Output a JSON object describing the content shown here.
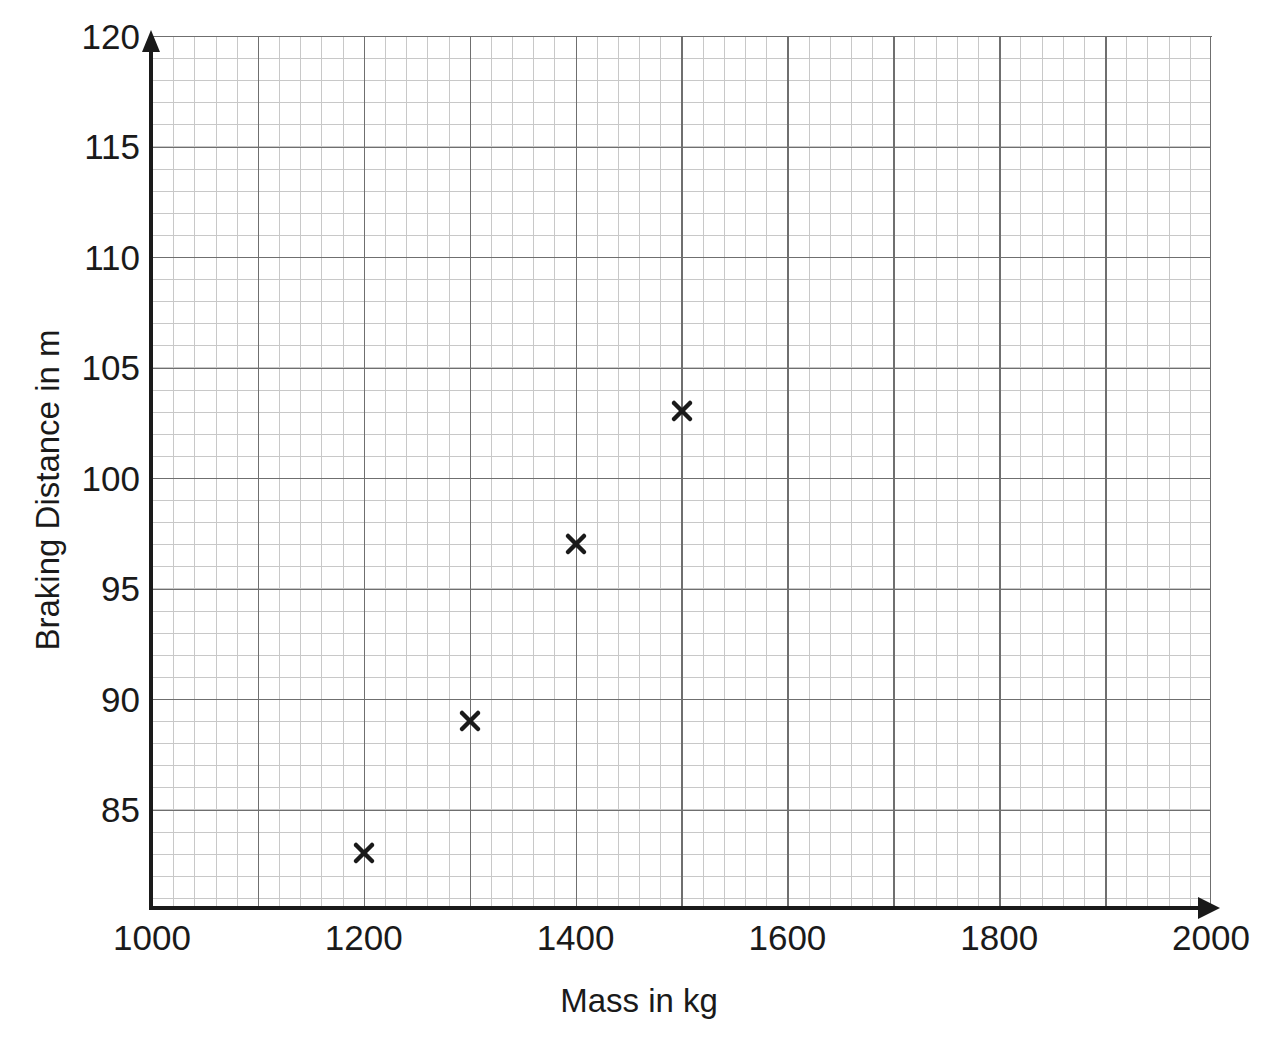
{
  "chart_data": {
    "type": "scatter",
    "title": "",
    "xlabel": "Mass in kg",
    "ylabel": "Braking Distance in m",
    "xlim": [
      1000,
      2000
    ],
    "ylim": [
      80.2,
      120
    ],
    "x_major_step": 200,
    "x_minor_step": 20,
    "y_major_step": 5,
    "y_minor_step": 1,
    "grid": true,
    "legend": null,
    "x_ticks": [
      "1000",
      "1200",
      "1400",
      "1600",
      "1800",
      "2000"
    ],
    "x_tick_values": [
      1000,
      1200,
      1400,
      1600,
      1800,
      2000
    ],
    "y_ticks": [
      "85",
      "90",
      "95",
      "100",
      "105",
      "110",
      "115",
      "120"
    ],
    "y_tick_values": [
      85,
      90,
      95,
      100,
      105,
      110,
      115,
      120
    ],
    "points": [
      {
        "x": 1200,
        "y": 83,
        "marker": "x-cross"
      },
      {
        "x": 1300,
        "y": 89,
        "marker": "x-cross"
      },
      {
        "x": 1400,
        "y": 97,
        "marker": "x-cross"
      },
      {
        "x": 1500,
        "y": 103,
        "marker": "x-cross"
      }
    ],
    "colors": {
      "axis": "#1a1a1a",
      "major_grid": "#6f6f6f",
      "minor_grid": "#c8c8c8",
      "marker": "#1a1a1a",
      "background": "#ffffff"
    }
  }
}
